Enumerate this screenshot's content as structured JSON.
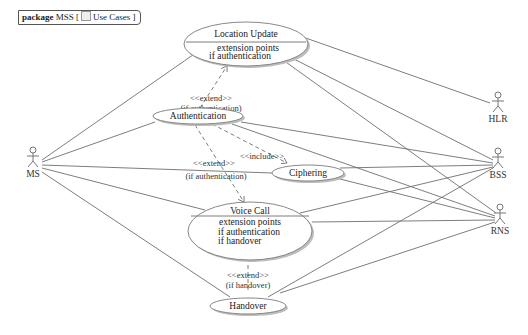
{
  "package": {
    "keyword": "package",
    "name": "MSS",
    "diagram_bracket_open": "[",
    "diagram_icon": "use-case-diagram-icon",
    "diagram_type": "Use Cases",
    "diagram_bracket_close": "]"
  },
  "actors": [
    {
      "id": "ms",
      "name": "MS"
    },
    {
      "id": "hlr",
      "name": "HLR"
    },
    {
      "id": "bss",
      "name": "BSS"
    },
    {
      "id": "rns",
      "name": "RNS"
    }
  ],
  "use_cases": {
    "location_update": {
      "name": "Location Update",
      "ext_header": "extension points",
      "ext_points": [
        "if authentication"
      ]
    },
    "authentication": {
      "name": "Authentication"
    },
    "ciphering": {
      "name": "Ciphering"
    },
    "voice_call": {
      "name": "Voice Call",
      "ext_header": "extension points",
      "ext_points": [
        "if authentication",
        "if handover"
      ]
    },
    "handover": {
      "name": "Handover"
    }
  },
  "relations": {
    "auth_extends_lu": {
      "stereotype": "<<extend>>",
      "condition": "(if authentication)"
    },
    "auth_extends_vc": {
      "stereotype": "<<extend>>",
      "condition": "(if authentication)"
    },
    "auth_includes_ciph": {
      "stereotype": "<<include>>"
    },
    "handover_extends_vc": {
      "stereotype": "<<extend>>",
      "condition": "(if handover)"
    }
  },
  "colors": {
    "line": "#6e6e6e",
    "usecase_fill": "#ffffff",
    "usecase_stroke": "#7a7a7a",
    "shadow": "#bdbdbd"
  }
}
